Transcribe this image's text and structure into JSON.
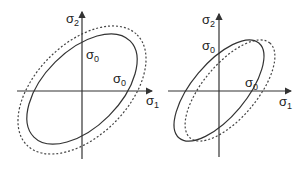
{
  "figure": {
    "panels": [
      {
        "id": "left",
        "labels": {
          "y_axis": {
            "symbol": "σ",
            "sub": "2"
          },
          "x_axis": {
            "symbol": "σ",
            "sub": "1"
          },
          "y_intercept": {
            "symbol": "σ",
            "sub": "0"
          },
          "x_intercept": {
            "symbol": "σ",
            "sub": "0"
          }
        },
        "curves": [
          {
            "name": "initial-yield-ellipse",
            "style": "solid"
          },
          {
            "name": "expanded-yield-ellipse",
            "style": "dashed",
            "relation": "isotropic expansion"
          }
        ]
      },
      {
        "id": "right",
        "labels": {
          "y_axis": {
            "symbol": "σ",
            "sub": "2"
          },
          "x_axis": {
            "symbol": "σ",
            "sub": "1"
          },
          "y_intercept": {
            "symbol": "σ",
            "sub": "0"
          },
          "x_intercept": {
            "symbol": "σ",
            "sub": "0"
          }
        },
        "curves": [
          {
            "name": "initial-yield-ellipse",
            "style": "solid"
          },
          {
            "name": "translated-yield-ellipse",
            "style": "dashed",
            "relation": "kinematic translation"
          }
        ]
      }
    ],
    "colors": {
      "line": "#333333",
      "text": "#222222",
      "background": "#ffffff"
    }
  }
}
